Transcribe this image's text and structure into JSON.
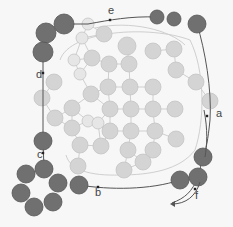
{
  "diagram": {
    "type": "circle-network-with-path",
    "colors": {
      "background": "#f7f7f7",
      "light_circle": "#d4d4d4",
      "light_stroke": "#c4c4c4",
      "pale_circle": "#e6e6e6",
      "dark_circle": "#707070",
      "dark_stroke": "#555555",
      "path_line": "#555555",
      "edge_line": "#cfcfcf",
      "label": "#444444"
    },
    "labels": [
      {
        "id": "a",
        "text": "a",
        "x": 216,
        "y": 117
      },
      {
        "id": "b",
        "text": "b",
        "x": 95,
        "y": 196
      },
      {
        "id": "c",
        "text": "c",
        "x": 37,
        "y": 158
      },
      {
        "id": "d",
        "text": "d",
        "x": 36,
        "y": 78
      },
      {
        "id": "e",
        "text": "e",
        "x": 108,
        "y": 14
      },
      {
        "id": "f",
        "text": "f",
        "x": 195,
        "y": 199
      }
    ],
    "path_markers": [
      {
        "x": 110,
        "y": 20
      },
      {
        "x": 43,
        "y": 73
      },
      {
        "x": 43,
        "y": 153
      },
      {
        "x": 98,
        "y": 187
      },
      {
        "x": 207,
        "y": 116
      },
      {
        "x": 195,
        "y": 189
      }
    ],
    "dark_circles": [
      {
        "x": 46,
        "y": 33,
        "r": 10
      },
      {
        "x": 64,
        "y": 24,
        "r": 10
      },
      {
        "x": 43,
        "y": 52,
        "r": 10
      },
      {
        "x": 43,
        "y": 141,
        "r": 9
      },
      {
        "x": 44,
        "y": 169,
        "r": 9
      },
      {
        "x": 26,
        "y": 174,
        "r": 9
      },
      {
        "x": 58,
        "y": 183,
        "r": 9
      },
      {
        "x": 21,
        "y": 193,
        "r": 9
      },
      {
        "x": 53,
        "y": 202,
        "r": 9
      },
      {
        "x": 34,
        "y": 207,
        "r": 9
      },
      {
        "x": 79,
        "y": 185,
        "r": 9
      },
      {
        "x": 157,
        "y": 17,
        "r": 7
      },
      {
        "x": 174,
        "y": 19,
        "r": 7
      },
      {
        "x": 197,
        "y": 24,
        "r": 9
      },
      {
        "x": 203,
        "y": 157,
        "r": 9
      },
      {
        "x": 198,
        "y": 177,
        "r": 9
      },
      {
        "x": 180,
        "y": 180,
        "r": 9
      }
    ],
    "pale_circles": [
      {
        "x": 88,
        "y": 24,
        "r": 6
      },
      {
        "x": 82,
        "y": 38,
        "r": 6
      },
      {
        "x": 74,
        "y": 60,
        "r": 6
      },
      {
        "x": 80,
        "y": 74,
        "r": 6
      },
      {
        "x": 88,
        "y": 121,
        "r": 6
      },
      {
        "x": 98,
        "y": 123,
        "r": 6
      }
    ],
    "light_circles": [
      {
        "x": 104,
        "y": 34,
        "r": 8
      },
      {
        "x": 72,
        "y": 108,
        "r": 8
      },
      {
        "x": 92,
        "y": 58,
        "r": 8
      },
      {
        "x": 54,
        "y": 82,
        "r": 8
      },
      {
        "x": 42,
        "y": 98,
        "r": 8
      },
      {
        "x": 55,
        "y": 118,
        "r": 8
      },
      {
        "x": 127,
        "y": 46,
        "r": 9
      },
      {
        "x": 119,
        "y": 50,
        "r": 0
      },
      {
        "x": 109,
        "y": 64,
        "r": 8
      },
      {
        "x": 129,
        "y": 64,
        "r": 8
      },
      {
        "x": 153,
        "y": 51,
        "r": 8
      },
      {
        "x": 174,
        "y": 49,
        "r": 8
      },
      {
        "x": 176,
        "y": 70,
        "r": 8
      },
      {
        "x": 108,
        "y": 87,
        "r": 8
      },
      {
        "x": 130,
        "y": 87,
        "r": 8
      },
      {
        "x": 153,
        "y": 87,
        "r": 8
      },
      {
        "x": 91,
        "y": 94,
        "r": 8
      },
      {
        "x": 110,
        "y": 109,
        "r": 8
      },
      {
        "x": 131,
        "y": 109,
        "r": 8
      },
      {
        "x": 153,
        "y": 109,
        "r": 8
      },
      {
        "x": 175,
        "y": 109,
        "r": 8
      },
      {
        "x": 91,
        "y": 124,
        "r": 0
      },
      {
        "x": 110,
        "y": 131,
        "r": 8
      },
      {
        "x": 131,
        "y": 131,
        "r": 8
      },
      {
        "x": 155,
        "y": 131,
        "r": 8
      },
      {
        "x": 175,
        "y": 96,
        "r": 0
      },
      {
        "x": 80,
        "y": 145,
        "r": 8
      },
      {
        "x": 101,
        "y": 146,
        "r": 8
      },
      {
        "x": 128,
        "y": 150,
        "r": 8
      },
      {
        "x": 153,
        "y": 150,
        "r": 8
      },
      {
        "x": 176,
        "y": 139,
        "r": 8
      },
      {
        "x": 196,
        "y": 82,
        "r": 8
      },
      {
        "x": 210,
        "y": 101,
        "r": 8
      },
      {
        "x": 72,
        "y": 128,
        "r": 8
      },
      {
        "x": 66,
        "y": 170,
        "r": 0
      },
      {
        "x": 95,
        "y": 162,
        "r": 0
      },
      {
        "x": 124,
        "y": 170,
        "r": 8
      },
      {
        "x": 143,
        "y": 162,
        "r": 8
      },
      {
        "x": 166,
        "y": 160,
        "r": 0
      },
      {
        "x": 78,
        "y": 166,
        "r": 8
      },
      {
        "x": 53,
        "y": 80,
        "r": 0
      },
      {
        "x": 43,
        "y": 99,
        "r": 0
      }
    ],
    "outer_path": "M157,17 C130,16 110,20 88,24 L64,24 M46,33 L43,52 L43,141 M43,141 L44,169 M79,185 C110,190 150,190 180,180 M197,24 C205,50 212,90 210,120 C208,140 206,150 203,157 L198,177 C192,192 185,198 172,203",
    "inner_loop": "M60,60 C70,30 150,25 190,40 C205,70 205,120 195,150 C180,170 150,175 120,175 C90,176 70,170 66,155"
  }
}
